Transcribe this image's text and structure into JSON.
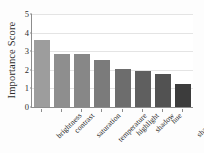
{
  "chart_data": {
    "type": "bar",
    "title": "",
    "subtitle": "",
    "xlabel": "",
    "ylabel": "Importance Score",
    "categories": [
      "brightness",
      "contrast",
      "saturation",
      "temperature",
      "highlight",
      "shadow",
      "hue",
      "sharpness"
    ],
    "values": [
      3.6,
      2.85,
      2.85,
      2.55,
      2.02,
      1.95,
      1.75,
      1.22
    ],
    "series": [
      {
        "name": "Importance Score",
        "values": [
          3.6,
          2.85,
          2.85,
          2.55,
          2.02,
          1.95,
          1.75,
          1.22
        ]
      }
    ],
    "bar_colors": [
      "#9d9d9d",
      "#8e8e8e",
      "#878787",
      "#7b7b7b",
      "#6d6d6d",
      "#5f5f5f",
      "#525252",
      "#3c3c3c"
    ],
    "ylim": [
      0,
      5
    ],
    "yticks": [
      0,
      1,
      2,
      3,
      4,
      5
    ],
    "ytick_labels": [
      "0",
      "1",
      "2",
      "3",
      "4",
      "5"
    ],
    "grid": true,
    "grid_axis": "y",
    "legend": "none",
    "axis_color": "#8d8d8d",
    "grid_color": "#e4e4e4",
    "background": "#ffffff"
  }
}
